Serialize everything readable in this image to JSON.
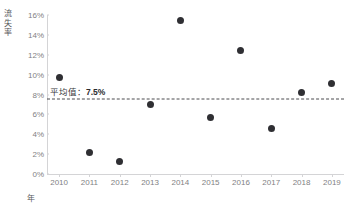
{
  "chart_data": {
    "type": "scatter",
    "title": "",
    "xlabel": "年",
    "ylabel": "流失率",
    "categories": [
      "2010",
      "2011",
      "2012",
      "2013",
      "2014",
      "2015",
      "2016",
      "2017",
      "2018",
      "2019"
    ],
    "x": [
      2010,
      2011,
      2012,
      2013,
      2014,
      2015,
      2016,
      2017,
      2018,
      2019
    ],
    "values": [
      9.7,
      2.2,
      1.3,
      7.0,
      15.4,
      5.7,
      12.4,
      4.6,
      8.2,
      9.1
    ],
    "series": [
      {
        "name": "流失率",
        "values": [
          9.7,
          2.2,
          1.3,
          7.0,
          15.4,
          5.7,
          12.4,
          4.6,
          8.2,
          9.1
        ]
      }
    ],
    "ylim": [
      0,
      16
    ],
    "xlim": [
      2009.6,
      2019.4
    ],
    "ytick_values": [
      0,
      2,
      4,
      6,
      8,
      10,
      12,
      14,
      16
    ],
    "ytick_labels": [
      "0%",
      "2%",
      "4%",
      "6%",
      "8%",
      "10%",
      "12%",
      "14%",
      "16%"
    ],
    "xtick_labels": [
      "2010",
      "2011",
      "2012",
      "2013",
      "2014",
      "2015",
      "2016",
      "2017",
      "2018",
      "2019"
    ],
    "grid": false,
    "legend": "none",
    "annotations": [
      {
        "type": "hline",
        "value": 7.5,
        "style": "dashed",
        "label_prefix": "平均值：",
        "label_value": "7.5%",
        "label_full": "平均值：7.5%"
      }
    ],
    "marker_color": "#2f2f33",
    "axis_color": "#d4d4d6",
    "tick_text_color": "#7f7f83",
    "annotation_color": "#3a3a3e",
    "background_color": "#ffffff"
  },
  "axes": {
    "y_title_chars": "流\n失\n率",
    "x_title": "年"
  }
}
